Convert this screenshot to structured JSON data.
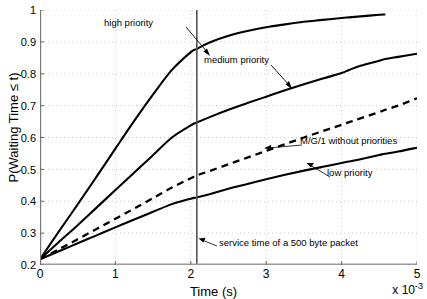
{
  "chart_data": {
    "type": "line",
    "title": "",
    "xlabel": "Time (s)",
    "ylabel": "P(Waiting Time ≤ t)",
    "x_exponent": "x 10",
    "x_exponent_power": "-3",
    "xlim": [
      0,
      5
    ],
    "ylim": [
      0.2,
      1
    ],
    "xticks": [
      0,
      1,
      2,
      3,
      4,
      5
    ],
    "xticklabels": [
      "0",
      "1",
      "2",
      "3",
      "4",
      "5"
    ],
    "yticks": [
      0.2,
      0.3,
      0.4,
      0.5,
      0.6,
      0.7,
      0.8,
      0.9,
      1
    ],
    "yticklabels": [
      "0.2",
      "0.3",
      "0.4",
      "0.5",
      "0.6",
      "0.7",
      "0.8",
      "0.9",
      "1"
    ],
    "grid": true,
    "grid_style": "dotted",
    "legend": "none",
    "x": [
      0,
      0.25,
      0.5,
      0.75,
      1.0,
      1.25,
      1.5,
      1.75,
      2.0,
      2.08,
      2.25,
      2.5,
      2.75,
      3.0,
      3.25,
      3.5,
      3.75,
      4.0,
      4.1,
      4.25,
      4.5,
      4.58,
      4.75,
      5.0
    ],
    "series": [
      {
        "name": "high priority",
        "style": "solid",
        "color": "#000000",
        "x_end": 4.58,
        "values": [
          0.218,
          0.305,
          0.39,
          0.477,
          0.565,
          0.652,
          0.735,
          0.812,
          0.868,
          0.878,
          0.898,
          0.919,
          0.934,
          0.946,
          0.955,
          0.963,
          0.969,
          0.975,
          0.977,
          0.98,
          0.985,
          0.986,
          null,
          null
        ]
      },
      {
        "name": "medium priority",
        "style": "solid",
        "color": "#000000",
        "x_end": 5.0,
        "values": [
          0.218,
          0.272,
          0.325,
          0.38,
          0.435,
          0.49,
          0.545,
          0.6,
          0.638,
          0.647,
          0.664,
          0.687,
          0.708,
          0.728,
          0.748,
          0.767,
          0.785,
          0.802,
          0.812,
          0.825,
          0.841,
          0.846,
          0.853,
          0.863
        ]
      },
      {
        "name": "M/G/1 without priorities",
        "style": "dashed",
        "color": "#000000",
        "x_end": 5.0,
        "values": [
          0.218,
          0.249,
          0.281,
          0.313,
          0.345,
          0.377,
          0.41,
          0.443,
          0.472,
          0.481,
          0.495,
          0.516,
          0.537,
          0.558,
          0.579,
          0.6,
          0.62,
          0.64,
          0.648,
          0.66,
          0.68,
          0.687,
          0.7,
          0.723
        ]
      },
      {
        "name": "low priority",
        "style": "solid",
        "color": "#000000",
        "x_end": 5.0,
        "values": [
          0.218,
          0.243,
          0.268,
          0.293,
          0.318,
          0.343,
          0.367,
          0.391,
          0.408,
          0.412,
          0.422,
          0.439,
          0.454,
          0.469,
          0.483,
          0.496,
          0.508,
          0.52,
          0.525,
          0.532,
          0.545,
          0.549,
          0.556,
          0.568
        ]
      }
    ],
    "markers": [
      {
        "name": "service time of a 500 byte packet",
        "type": "vline",
        "x": 2.08,
        "color": "#555555"
      }
    ],
    "annotations": [
      {
        "id": "high",
        "text": "high priority"
      },
      {
        "id": "medium",
        "text": "medium priority"
      },
      {
        "id": "mg1",
        "text": "M/G/1 without priorities"
      },
      {
        "id": "low",
        "text": "low priority"
      },
      {
        "id": "service",
        "text": "service time of a 500 byte packet"
      }
    ]
  }
}
